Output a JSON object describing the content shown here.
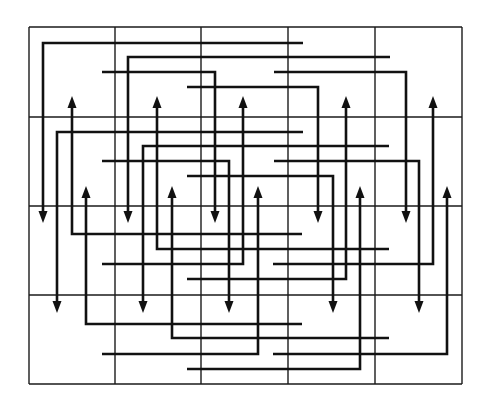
{
  "diagram": {
    "type": "grid-routing-diagram",
    "colors": {
      "background": "#ffffff",
      "line": "#111111",
      "grid": "#1a1a1a"
    },
    "grid": {
      "columns_x": [
        29,
        115,
        201,
        288,
        375,
        462
      ],
      "rows_y": [
        27,
        117,
        206,
        295,
        384
      ]
    },
    "paths": [
      {
        "id": "r1-a",
        "points": [
          [
            303,
            43
          ],
          [
            43,
            43
          ],
          [
            43,
            223
          ]
        ],
        "arrow": "end"
      },
      {
        "id": "r1-b",
        "points": [
          [
            390,
            57
          ],
          [
            128,
            57
          ],
          [
            128,
            223
          ]
        ],
        "arrow": "end"
      },
      {
        "id": "r1-c",
        "points": [
          [
            102,
            72
          ],
          [
            215,
            72
          ],
          [
            215,
            223
          ]
        ],
        "arrow": "end"
      },
      {
        "id": "r1-d",
        "points": [
          [
            274,
            72
          ],
          [
            406,
            72
          ],
          [
            406,
            223
          ]
        ],
        "arrow": "end"
      },
      {
        "id": "r1-e",
        "points": [
          [
            187,
            87
          ],
          [
            318,
            87
          ],
          [
            318,
            223
          ]
        ],
        "arrow": "end"
      },
      {
        "id": "r2-a",
        "points": [
          [
            303,
            132
          ],
          [
            57,
            132
          ],
          [
            57,
            313
          ]
        ],
        "arrow": "end"
      },
      {
        "id": "r2-b",
        "points": [
          [
            389,
            146
          ],
          [
            143,
            146
          ],
          [
            143,
            313
          ]
        ],
        "arrow": "end"
      },
      {
        "id": "r2-c",
        "points": [
          [
            102,
            161
          ],
          [
            229,
            161
          ],
          [
            229,
            313
          ]
        ],
        "arrow": "end"
      },
      {
        "id": "r2-d",
        "points": [
          [
            274,
            161
          ],
          [
            419,
            161
          ],
          [
            419,
            313
          ]
        ],
        "arrow": "end"
      },
      {
        "id": "r2-e",
        "points": [
          [
            187,
            176
          ],
          [
            333,
            176
          ],
          [
            333,
            313
          ]
        ],
        "arrow": "end"
      },
      {
        "id": "r3-a",
        "points": [
          [
            302,
            234
          ],
          [
            72,
            234
          ],
          [
            72,
            96
          ]
        ],
        "arrow": "end"
      },
      {
        "id": "r3-b",
        "points": [
          [
            389,
            249
          ],
          [
            157,
            249
          ],
          [
            157,
            96
          ]
        ],
        "arrow": "end"
      },
      {
        "id": "r3-c",
        "points": [
          [
            102,
            264
          ],
          [
            243,
            264
          ],
          [
            243,
            96
          ]
        ],
        "arrow": "end"
      },
      {
        "id": "r3-d",
        "points": [
          [
            273,
            264
          ],
          [
            433,
            264
          ],
          [
            433,
            96
          ]
        ],
        "arrow": "end"
      },
      {
        "id": "r3-e",
        "points": [
          [
            187,
            279
          ],
          [
            346,
            279
          ],
          [
            346,
            96
          ]
        ],
        "arrow": "end"
      },
      {
        "id": "r4-a",
        "points": [
          [
            302,
            324
          ],
          [
            86,
            324
          ],
          [
            86,
            186
          ]
        ],
        "arrow": "end"
      },
      {
        "id": "r4-b",
        "points": [
          [
            389,
            338
          ],
          [
            172,
            338
          ],
          [
            172,
            186
          ]
        ],
        "arrow": "end"
      },
      {
        "id": "r4-c",
        "points": [
          [
            102,
            354
          ],
          [
            258,
            354
          ],
          [
            258,
            186
          ]
        ],
        "arrow": "end"
      },
      {
        "id": "r4-d",
        "points": [
          [
            273,
            354
          ],
          [
            447,
            354
          ],
          [
            447,
            186
          ]
        ],
        "arrow": "end"
      },
      {
        "id": "r4-e",
        "points": [
          [
            187,
            369
          ],
          [
            360,
            369
          ],
          [
            360,
            186
          ]
        ],
        "arrow": "end"
      }
    ]
  }
}
